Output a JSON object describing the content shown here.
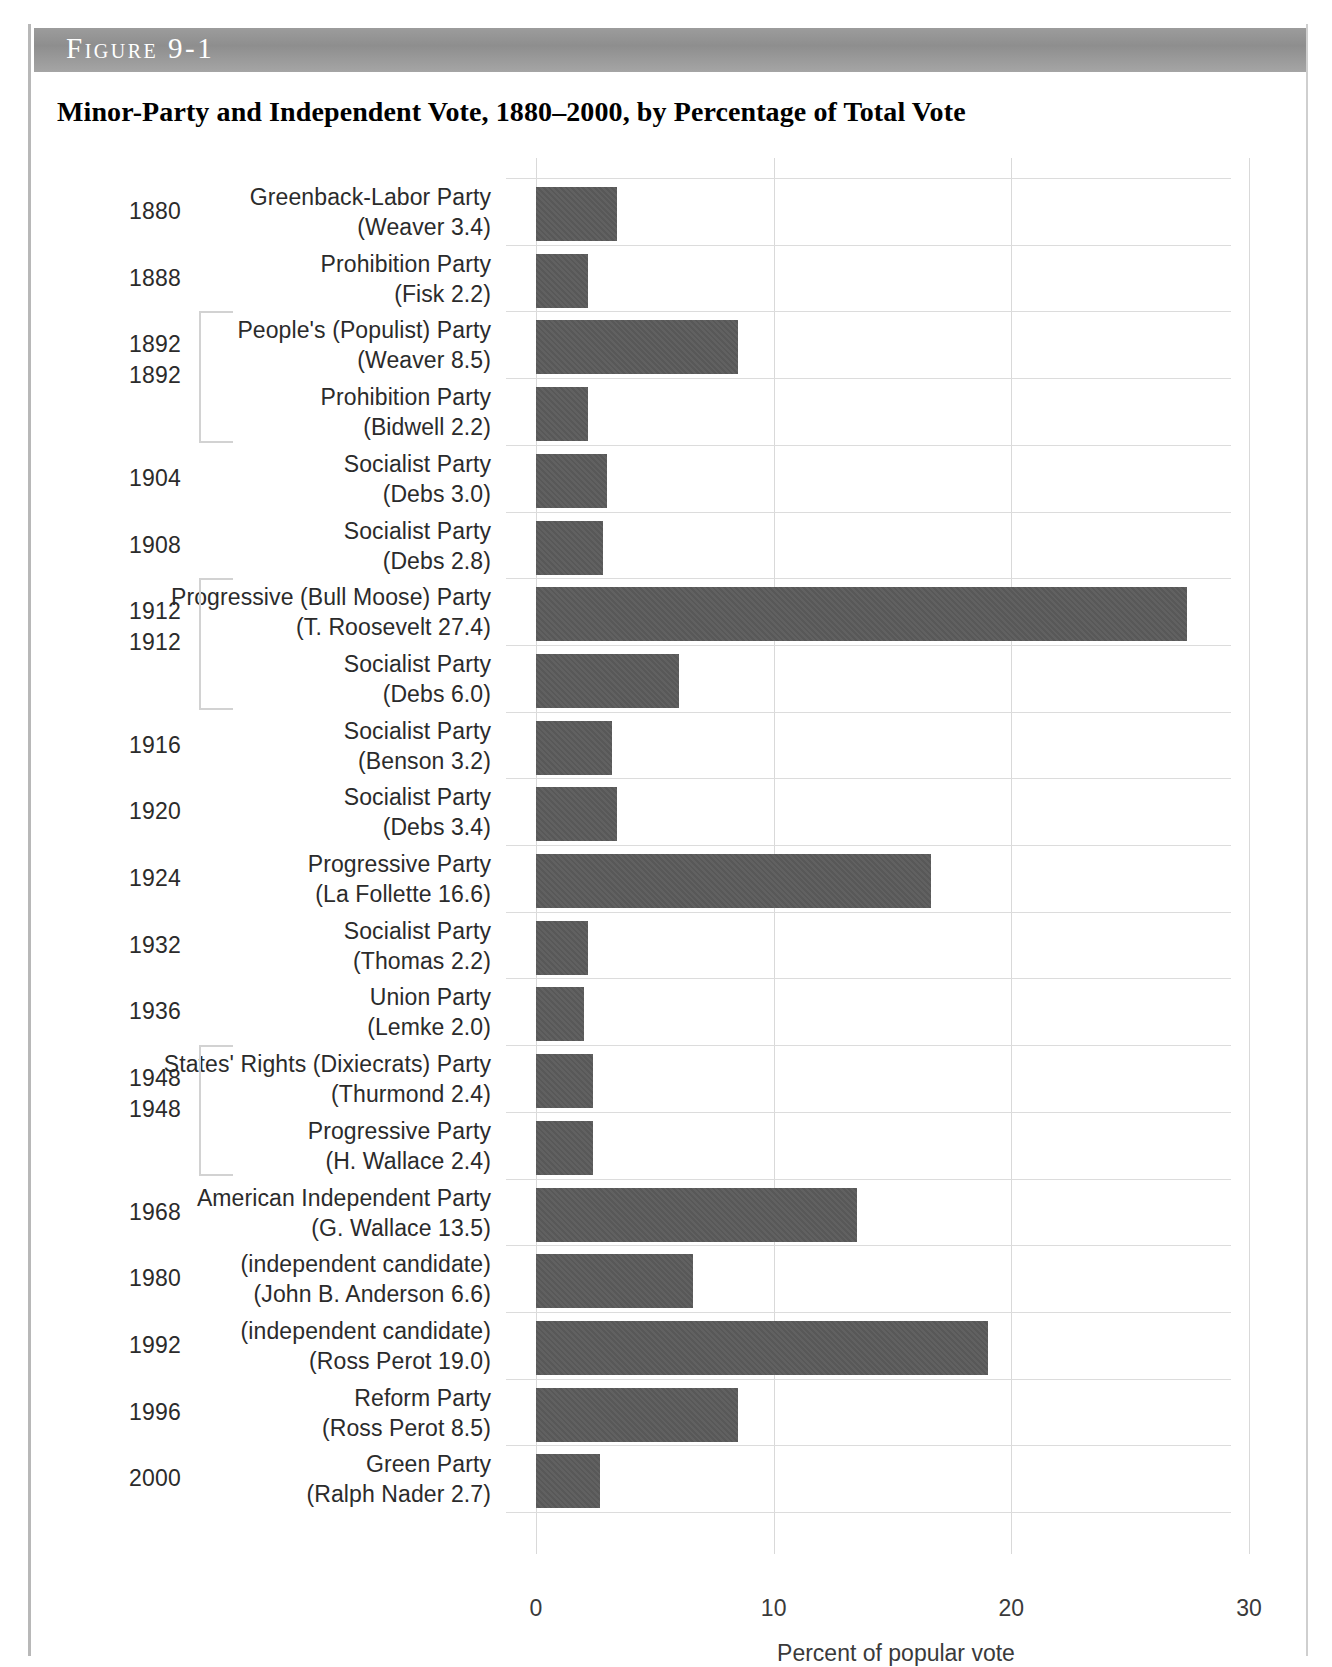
{
  "figure": {
    "banner_label": "Figure 9-1",
    "title": "Minor-Party and Independent Vote, 1880–2000, by Percentage of Total Vote"
  },
  "chart_data": {
    "type": "bar",
    "orientation": "horizontal",
    "title": "Minor-Party and Independent Vote, 1880–2000, by Percentage of Total Vote",
    "xlabel": "Percent of popular vote",
    "ylabel": "",
    "xlim": [
      0,
      30
    ],
    "xticks": [
      "0",
      "10",
      "20",
      "30"
    ],
    "grid": true,
    "legend": "none",
    "bar_color": "#585858",
    "categories": [
      "Greenback-Labor Party (Weaver 3.4)",
      "Prohibition Party (Fisk 2.2)",
      "People's (Populist) Party (Weaver 8.5)",
      "Prohibition Party (Bidwell 2.2)",
      "Socialist Party (Debs 3.0)",
      "Socialist Party (Debs 2.8)",
      "Progressive (Bull Moose) Party (T. Roosevelt 27.4)",
      "Socialist Party (Debs 6.0)",
      "Socialist Party (Benson 3.2)",
      "Socialist Party (Debs 3.4)",
      "Progressive Party (La Follette 16.6)",
      "Socialist Party (Thomas 2.2)",
      "Union Party (Lemke 2.0)",
      "States' Rights (Dixiecrats) Party (Thurmond 2.4)",
      "Progressive Party (H. Wallace 2.4)",
      "American Independent Party (G. Wallace 13.5)",
      "(independent candidate) (John B. Anderson 6.6)",
      "(independent candidate) (Ross Perot 19.0)",
      "Reform Party (Ross Perot 8.5)",
      "Green Party (Ralph Nader 2.7)"
    ],
    "values": [
      3.4,
      2.2,
      8.5,
      2.2,
      3.0,
      2.8,
      27.4,
      6.0,
      3.2,
      3.4,
      16.6,
      2.2,
      2.0,
      2.4,
      2.4,
      13.5,
      6.6,
      19.0,
      8.5,
      2.7
    ]
  },
  "rows": [
    {
      "year": "1880",
      "party": "Greenback-Labor Party",
      "candidate": "(Weaver 3.4)",
      "value": 3.4
    },
    {
      "year": "1888",
      "party": "Prohibition Party",
      "candidate": "(Fisk 2.2)",
      "value": 2.2
    },
    {
      "year": "1892",
      "party": "People's (Populist) Party",
      "candidate": "(Weaver 8.5)",
      "value": 8.5
    },
    {
      "year": "",
      "party": "Prohibition Party",
      "candidate": "(Bidwell 2.2)",
      "value": 2.2
    },
    {
      "year": "1904",
      "party": "Socialist Party",
      "candidate": "(Debs 3.0)",
      "value": 3.0
    },
    {
      "year": "1908",
      "party": "Socialist Party",
      "candidate": "(Debs 2.8)",
      "value": 2.8
    },
    {
      "year": "1912",
      "party": "Progressive (Bull Moose) Party",
      "candidate": "(T. Roosevelt 27.4)",
      "value": 27.4
    },
    {
      "year": "",
      "party": "Socialist Party",
      "candidate": "(Debs 6.0)",
      "value": 6.0
    },
    {
      "year": "1916",
      "party": "Socialist Party",
      "candidate": "(Benson 3.2)",
      "value": 3.2
    },
    {
      "year": "1920",
      "party": "Socialist Party",
      "candidate": "(Debs 3.4)",
      "value": 3.4
    },
    {
      "year": "1924",
      "party": "Progressive Party",
      "candidate": "(La Follette 16.6)",
      "value": 16.6
    },
    {
      "year": "1932",
      "party": "Socialist Party",
      "candidate": "(Thomas 2.2)",
      "value": 2.2
    },
    {
      "year": "1936",
      "party": "Union Party",
      "candidate": "(Lemke 2.0)",
      "value": 2.0
    },
    {
      "year": "1948",
      "party": "States' Rights (Dixiecrats) Party",
      "candidate": "(Thurmond 2.4)",
      "value": 2.4
    },
    {
      "year": "",
      "party": "Progressive Party",
      "candidate": "(H. Wallace 2.4)",
      "value": 2.4
    },
    {
      "year": "1968",
      "party": "American Independent Party",
      "candidate": "(G. Wallace 13.5)",
      "value": 13.5
    },
    {
      "year": "1980",
      "party": "(independent candidate)",
      "candidate": "(John B. Anderson 6.6)",
      "value": 6.6
    },
    {
      "year": "1992",
      "party": "(independent candidate)",
      "candidate": "(Ross Perot 19.0)",
      "value": 19.0
    },
    {
      "year": "1996",
      "party": "Reform Party",
      "candidate": "(Ross Perot 8.5)",
      "value": 8.5
    },
    {
      "year": "2000",
      "party": "Green Party",
      "candidate": "(Ralph Nader 2.7)",
      "value": 2.7
    }
  ],
  "year_group_labels": [
    {
      "year": "1892",
      "row_start": 2,
      "row_end": 3
    },
    {
      "year": "1912",
      "row_start": 6,
      "row_end": 7
    },
    {
      "year": "1948",
      "row_start": 13,
      "row_end": 14
    }
  ],
  "axis": {
    "ticks": [
      "0",
      "10",
      "20",
      "30"
    ],
    "tick_values": [
      0,
      10,
      20,
      30
    ],
    "title": "Percent of popular vote"
  }
}
